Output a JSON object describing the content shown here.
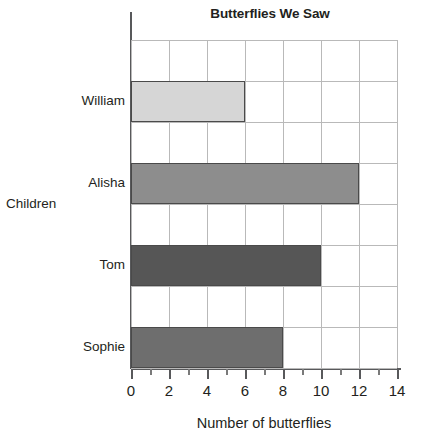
{
  "chart_data": {
    "type": "bar",
    "orientation": "horizontal",
    "title": "Butterflies We Saw",
    "xlabel": "Number of butterflies",
    "ylabel": "Children",
    "categories": [
      "William",
      "Alisha",
      "Tom",
      "Sophie"
    ],
    "values": [
      6,
      12,
      10,
      8
    ],
    "bar_colors": [
      "#d6d6d6",
      "#8d8d8d",
      "#565656",
      "#6e6e6e"
    ],
    "bar_border_color": "#4a4a4a",
    "xlim": [
      0,
      14
    ],
    "xticks": [
      0,
      2,
      4,
      6,
      8,
      10,
      12,
      14
    ],
    "xtick_labels": [
      "0",
      "2",
      "4",
      "6",
      "8",
      "10",
      "12",
      "14"
    ],
    "minor_tick_step": 1,
    "grid": true,
    "grid_color": "#b9b9b9",
    "legend": null,
    "axis_color": "#58595b",
    "background": "#ffffff"
  }
}
